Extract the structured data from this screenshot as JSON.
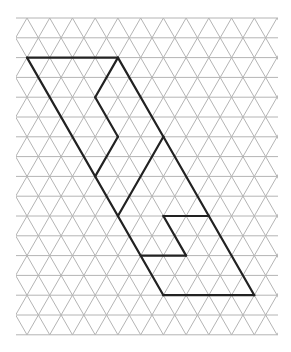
{
  "figure": {
    "width": 291,
    "height": 352,
    "background": "#ffffff"
  },
  "grid": {
    "type": "triangular",
    "origin_x": 27,
    "origin_y": 18,
    "side": 22.73,
    "row_height": 19.8,
    "rows": 16,
    "cols": 11,
    "left": 16,
    "right": 278,
    "top": 18,
    "bottom": 335,
    "line_color": "#b4b4b4"
  },
  "shape": {
    "line_color": "#222222",
    "coordinate_system": "lattice points [row, k]; x = origin_x + side*k - (row odd ? side/2 : 0), y = origin_y + row_height*row",
    "segments": [
      [
        [
          2,
          0
        ],
        [
          2,
          4
        ]
      ],
      [
        [
          2,
          0
        ],
        [
          14,
          6
        ]
      ],
      [
        [
          2,
          4
        ],
        [
          4,
          3
        ]
      ],
      [
        [
          4,
          3
        ],
        [
          6,
          4
        ]
      ],
      [
        [
          6,
          4
        ],
        [
          8,
          3
        ]
      ],
      [
        [
          2,
          4
        ],
        [
          6,
          6
        ]
      ],
      [
        [
          6,
          6
        ],
        [
          14,
          10
        ]
      ],
      [
        [
          6,
          6
        ],
        [
          10,
          4
        ]
      ],
      [
        [
          10,
          6
        ],
        [
          10,
          8
        ]
      ],
      [
        [
          10,
          6
        ],
        [
          12,
          7
        ]
      ],
      [
        [
          12,
          5
        ],
        [
          12,
          7
        ]
      ],
      [
        [
          14,
          6
        ],
        [
          14,
          10
        ]
      ]
    ]
  }
}
